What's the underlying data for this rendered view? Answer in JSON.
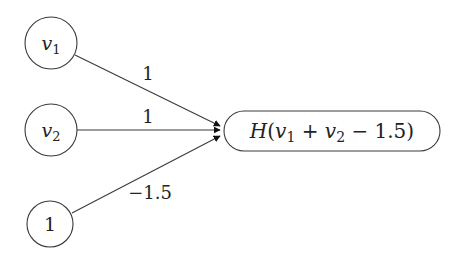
{
  "diagram": {
    "type": "perceptron-neuron",
    "inputs": [
      {
        "id": "v1",
        "var": "v",
        "sub": "1"
      },
      {
        "id": "v2",
        "var": "v",
        "sub": "2"
      },
      {
        "id": "bias",
        "label": "1"
      }
    ],
    "weights": [
      {
        "from": "v1",
        "to": "output",
        "label": "1"
      },
      {
        "from": "v2",
        "to": "output",
        "label": "1"
      },
      {
        "from": "bias",
        "to": "output",
        "label": "−1.5"
      }
    ],
    "output": {
      "id": "output",
      "parts": {
        "func": "H",
        "open": "(",
        "v1": "v",
        "s1": "1",
        "plus": " + ",
        "v2": "v",
        "s2": "2",
        "minus": " − 1.5",
        "close": ")"
      }
    },
    "colors": {
      "stroke": "#3a3a3a",
      "text": "#222222"
    }
  }
}
